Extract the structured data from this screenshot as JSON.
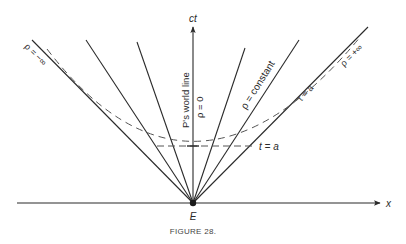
{
  "figure": {
    "caption": "FIGURE 28.",
    "colors": {
      "ink": "#2a2a2a",
      "dash": "#555555",
      "background": "#ffffff"
    }
  },
  "axes": {
    "time_axis_label": "ct",
    "space_axis_label": "x",
    "origin_label": "E"
  },
  "lines": {
    "rho_minus_inf": "ρ = −∞",
    "rho_zero": "ρ = 0",
    "world_line": "P's world line",
    "rho_constant": "ρ = constant",
    "tau_a": "τ = a",
    "rho_plus_inf": "ρ = +∞",
    "t_a": "t = a"
  }
}
